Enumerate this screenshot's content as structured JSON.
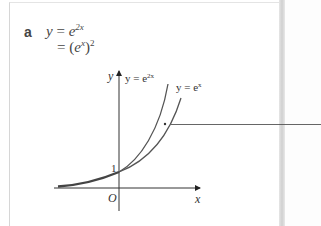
{
  "part": {
    "label": "a"
  },
  "working": {
    "line1": {
      "lhs": "y",
      "equals": "=",
      "base": "e",
      "exponent": "2x"
    },
    "line2": {
      "equals": "=",
      "open": "(",
      "base": "e",
      "exponent": "x",
      "close": ")",
      "power": "2"
    }
  },
  "graph": {
    "axis_y_label": "y",
    "axis_x_label": "x",
    "origin_label": "O",
    "intercept_label": "1",
    "curve1_label_lhs": "y = e",
    "curve1_label_exp": "2x",
    "curve2_label_lhs": "y = e",
    "curve2_label_exp": "x",
    "colors": {
      "curves": "#555555",
      "axes": "#333333",
      "leader": "#555555"
    }
  }
}
